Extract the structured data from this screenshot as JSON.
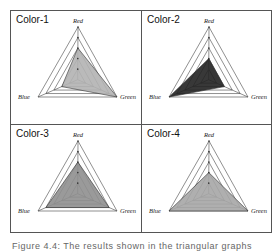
{
  "figure": {
    "caption": "Figure 4.4: The results shown in the triangular graphs",
    "panels": [
      {
        "title": "Color-1",
        "fill": "#b3b3b3",
        "values": {
          "Red": 60,
          "Green": 100,
          "Blue": 40
        }
      },
      {
        "title": "Color-2",
        "fill": "#222222",
        "values": {
          "Red": 40,
          "Green": 40,
          "Blue": 100
        }
      },
      {
        "title": "Color-3",
        "fill": "#8f8f8f",
        "values": {
          "Red": 60,
          "Green": 80,
          "Blue": 80
        }
      },
      {
        "title": "Color-4",
        "fill": "#a6a6a6",
        "values": {
          "Red": 40,
          "Green": 100,
          "Blue": 100
        }
      }
    ],
    "axes": [
      "Red",
      "Green",
      "Blue"
    ]
  },
  "chart_data": [
    {
      "type": "radar",
      "title": "Color-1",
      "categories": [
        "Red",
        "Green",
        "Blue"
      ],
      "values": [
        60,
        100,
        40
      ],
      "range": [
        0,
        100
      ],
      "rings": 5
    },
    {
      "type": "radar",
      "title": "Color-2",
      "categories": [
        "Red",
        "Green",
        "Blue"
      ],
      "values": [
        40,
        40,
        100
      ],
      "range": [
        0,
        100
      ],
      "rings": 5
    },
    {
      "type": "radar",
      "title": "Color-3",
      "categories": [
        "Red",
        "Green",
        "Blue"
      ],
      "values": [
        60,
        80,
        80
      ],
      "range": [
        0,
        100
      ],
      "rings": 5
    },
    {
      "type": "radar",
      "title": "Color-4",
      "categories": [
        "Red",
        "Green",
        "Blue"
      ],
      "values": [
        40,
        100,
        100
      ],
      "range": [
        0,
        100
      ],
      "rings": 5
    }
  ]
}
